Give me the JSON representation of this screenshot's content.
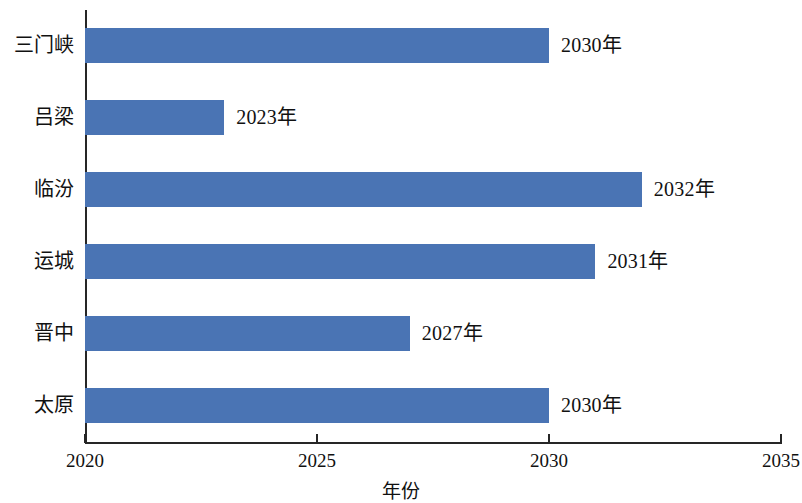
{
  "chart_data": {
    "type": "bar",
    "orientation": "horizontal",
    "title": "",
    "xlabel": "年份",
    "ylabel": "",
    "categories": [
      "太原",
      "晋中",
      "运城",
      "临汾",
      "吕梁",
      "三门峡"
    ],
    "values": [
      2030,
      2027,
      2031,
      2032,
      2023,
      2030
    ],
    "data_labels": [
      "2030年",
      "2027年",
      "2031年",
      "2032年",
      "2023年",
      "2030年"
    ],
    "xlim": [
      2020,
      2035
    ],
    "xticks": [
      2020,
      2025,
      2030,
      2035
    ],
    "xtick_labels": [
      "2020",
      "2025",
      "2030",
      "2035"
    ],
    "grid": false,
    "legend": false,
    "series": [
      {
        "name": "",
        "color": "#4a74b4",
        "values": [
          2030,
          2027,
          2031,
          2032,
          2023,
          2030
        ]
      }
    ],
    "bars_top_to_bottom": [
      {
        "category": "三门峡",
        "value": 2030,
        "label": "2030年"
      },
      {
        "category": "吕梁",
        "value": 2023,
        "label": "2023年"
      },
      {
        "category": "临汾",
        "value": 2032,
        "label": "2032年"
      },
      {
        "category": "运城",
        "value": 2031,
        "label": "2031年"
      },
      {
        "category": "晋中",
        "value": 2027,
        "label": "2027年"
      },
      {
        "category": "太原",
        "value": 2030,
        "label": "2030年"
      }
    ]
  },
  "colors": {
    "bar": "#4a74b4",
    "axis": "#262626",
    "text": "#111111",
    "background": "#ffffff"
  }
}
